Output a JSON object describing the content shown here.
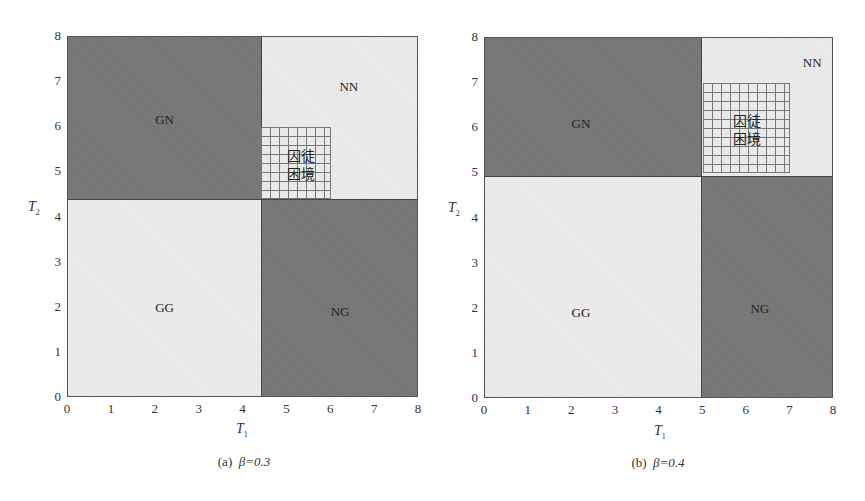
{
  "chart_data": [
    {
      "type": "heatmap",
      "subtype": "region-partition",
      "caption": "(a)  β=0.3",
      "caption_prefix": "(a)",
      "beta": "β=0.3",
      "xlabel": "T1",
      "ylabel": "T2",
      "xlim": [
        0,
        8
      ],
      "ylim": [
        0,
        8
      ],
      "xticks": [
        0,
        1,
        2,
        3,
        4,
        5,
        6,
        7,
        8
      ],
      "yticks": [
        0,
        1,
        2,
        3,
        4,
        5,
        6,
        7,
        8
      ],
      "grid": false,
      "threshold": 4.4,
      "regions": [
        {
          "label": "GN",
          "x": [
            0,
            4.4
          ],
          "y": [
            4.4,
            8
          ],
          "shade": "dark"
        },
        {
          "label": "NN",
          "x": [
            4.4,
            8
          ],
          "y": [
            4.4,
            8
          ],
          "shade": "light"
        },
        {
          "label": "GG",
          "x": [
            0,
            4.4
          ],
          "y": [
            0,
            4.4
          ],
          "shade": "light"
        },
        {
          "label": "NG",
          "x": [
            4.4,
            8
          ],
          "y": [
            0,
            4.4
          ],
          "shade": "dark"
        }
      ],
      "highlight": {
        "label_line1": "囚徒",
        "label_line2": "困境",
        "label": "囚徒困境",
        "x": [
          4.4,
          6
        ],
        "y": [
          4.4,
          6
        ],
        "pattern": "grid-hatch"
      }
    },
    {
      "type": "heatmap",
      "subtype": "region-partition",
      "caption": "(b)  β=0.4",
      "caption_prefix": "(b)",
      "beta": "β=0.4",
      "xlabel": "T1",
      "ylabel": "T2",
      "xlim": [
        0,
        8
      ],
      "ylim": [
        0,
        8
      ],
      "xticks": [
        0,
        1,
        2,
        3,
        4,
        5,
        6,
        7,
        8
      ],
      "yticks": [
        0,
        1,
        2,
        3,
        4,
        5,
        6,
        7,
        8
      ],
      "grid": false,
      "threshold": 4.95,
      "regions": [
        {
          "label": "GN",
          "x": [
            0,
            4.95
          ],
          "y": [
            4.95,
            8
          ],
          "shade": "dark"
        },
        {
          "label": "NN",
          "x": [
            4.95,
            8
          ],
          "y": [
            4.95,
            8
          ],
          "shade": "light"
        },
        {
          "label": "GG",
          "x": [
            0,
            4.95
          ],
          "y": [
            0,
            4.95
          ],
          "shade": "light"
        },
        {
          "label": "NG",
          "x": [
            4.95,
            8
          ],
          "y": [
            0,
            4.95
          ],
          "shade": "dark"
        }
      ],
      "highlight": {
        "label_line1": "囚徒",
        "label_line2": "困境",
        "label": "囚徒困境",
        "x": [
          5,
          7
        ],
        "y": [
          5,
          7
        ],
        "pattern": "grid-hatch"
      }
    }
  ],
  "axis": {
    "x_title": "T",
    "x_sub": "1",
    "y_title": "T",
    "y_sub": "2"
  },
  "colors": {
    "dark_region": "#7a7a7a",
    "light_region": "#ececec",
    "hatch_line": "#777777",
    "border": "#555555"
  }
}
